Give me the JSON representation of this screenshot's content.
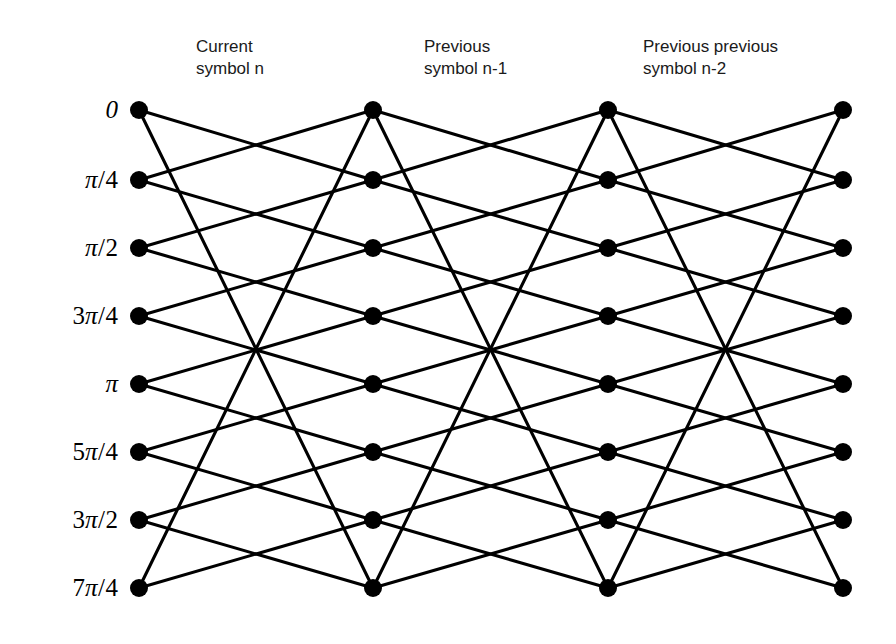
{
  "figure": {
    "type": "trellis-diagram",
    "title": "",
    "background_color": "#ffffff",
    "line_color": "#000000",
    "node_color": "#000000",
    "label_color": "#000000",
    "header_color": "#1a1a1a"
  },
  "columns": [
    {
      "id": "col-current",
      "header_line1": "Current",
      "header_line2": "symbol n",
      "header_text": "Current\nsymbol n",
      "x": 139,
      "header_x": 196,
      "header_y": 36
    },
    {
      "id": "col-previous",
      "header_line1": "Previous",
      "header_line2": "symbol n-1",
      "header_text": "Previous\nsymbol n-1",
      "x": 373,
      "header_x": 424,
      "header_y": 36
    },
    {
      "id": "col-previous-previous",
      "header_line1": "Previous previous",
      "header_line2": "symbol n-2",
      "header_text": "Previous previous\nsymbol n-2",
      "x": 608,
      "header_x": 643,
      "header_y": 36
    },
    {
      "id": "col-fourth",
      "header_line1": "",
      "header_line2": "",
      "header_text": "",
      "x": 843,
      "header_x": 0,
      "header_y": 0
    }
  ],
  "rows": [
    {
      "index": 0,
      "label": "0",
      "numerator": "",
      "pi": "",
      "denominator": "",
      "y": 110
    },
    {
      "index": 1,
      "label": "π/4",
      "numerator": "",
      "pi": "π",
      "denominator": "4",
      "y": 180
    },
    {
      "index": 2,
      "label": "π/2",
      "numerator": "",
      "pi": "π",
      "denominator": "2",
      "y": 248
    },
    {
      "index": 3,
      "label": "3π/4",
      "numerator": "3",
      "pi": "π",
      "denominator": "4",
      "y": 316
    },
    {
      "index": 4,
      "label": "π",
      "numerator": "",
      "pi": "π",
      "denominator": "",
      "y": 384
    },
    {
      "index": 5,
      "label": "5π/4",
      "numerator": "5",
      "pi": "π",
      "denominator": "4",
      "y": 452
    },
    {
      "index": 6,
      "label": "3π/2",
      "numerator": "3",
      "pi": "π",
      "denominator": "2",
      "y": 520
    },
    {
      "index": 7,
      "label": "7π/4",
      "numerator": "7",
      "pi": "π",
      "denominator": "4",
      "y": 588
    }
  ],
  "label_right_x": 118,
  "node_radius": 9,
  "stages": [
    {
      "from_column": 0,
      "to_column": 1
    },
    {
      "from_column": 1,
      "to_column": 2
    },
    {
      "from_column": 2,
      "to_column": 3
    }
  ],
  "transitions": [
    {
      "from_row": 0,
      "to_rows": [
        1,
        7
      ]
    },
    {
      "from_row": 1,
      "to_rows": [
        2,
        0
      ]
    },
    {
      "from_row": 2,
      "to_rows": [
        3,
        1
      ]
    },
    {
      "from_row": 3,
      "to_rows": [
        4,
        2
      ]
    },
    {
      "from_row": 4,
      "to_rows": [
        5,
        3
      ]
    },
    {
      "from_row": 5,
      "to_rows": [
        6,
        4
      ]
    },
    {
      "from_row": 6,
      "to_rows": [
        7,
        5
      ]
    },
    {
      "from_row": 7,
      "to_rows": [
        0,
        6
      ]
    }
  ]
}
